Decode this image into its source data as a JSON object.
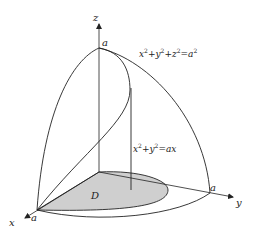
{
  "figure": {
    "type": "3d-region-diagram",
    "axes": {
      "x_label": "x",
      "y_label": "y",
      "z_label": "z"
    },
    "intercepts": {
      "z": "a",
      "x": "a",
      "y": "a"
    },
    "equations": {
      "sphere": {
        "lhs_terms": [
          "x",
          "2",
          "+y",
          "2",
          "+z",
          "2",
          "=a",
          "2"
        ],
        "text": "x²+y²+z²=a²"
      },
      "cylinder": {
        "text": "x²+y²=ax"
      }
    },
    "region_label": "D",
    "colors": {
      "stroke": "#222222",
      "region_fill": "#cfcfcf",
      "background": "#ffffff"
    }
  }
}
